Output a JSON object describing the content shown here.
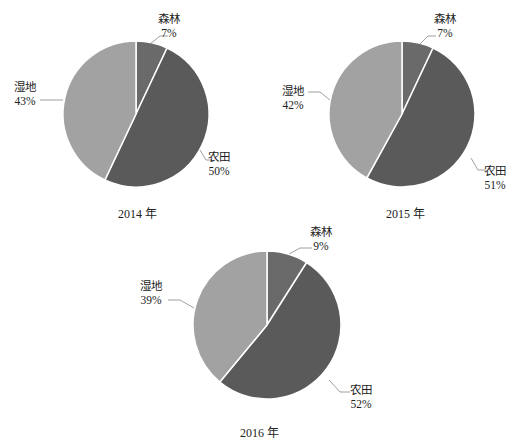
{
  "chart_data": [
    {
      "type": "pie",
      "title": "2014 年",
      "categories": [
        "森林",
        "农田",
        "湿地"
      ],
      "values": [
        7,
        50,
        43
      ],
      "labels": [
        "7%",
        "50%",
        "43%"
      ],
      "colors": [
        "#6a6a6a",
        "#5a5a5a",
        "#a2a2a2"
      ]
    },
    {
      "type": "pie",
      "title": "2015 年",
      "categories": [
        "森林",
        "农田",
        "湿地"
      ],
      "values": [
        7,
        51,
        42
      ],
      "labels": [
        "7%",
        "51%",
        "42%"
      ],
      "colors": [
        "#6a6a6a",
        "#5a5a5a",
        "#a2a2a2"
      ]
    },
    {
      "type": "pie",
      "title": "2016 年",
      "categories": [
        "森林",
        "农田",
        "湿地"
      ],
      "values": [
        9,
        52,
        39
      ],
      "labels": [
        "9%",
        "52%",
        "39%"
      ],
      "colors": [
        "#6a6a6a",
        "#5a5a5a",
        "#a2a2a2"
      ]
    }
  ]
}
